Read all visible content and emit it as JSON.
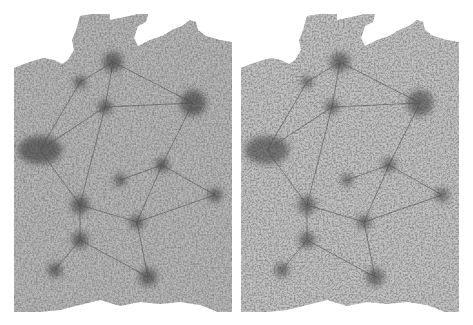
{
  "image": {
    "description": "Two side-by-side grayscale road-network density maps of the same country",
    "background": "#ffffff",
    "ink": "#3a3a3a",
    "panels": [
      {
        "id": "left",
        "offset_x": 0,
        "hubs": [
          {
            "x": 113,
            "y": 62,
            "r": 10
          },
          {
            "x": 193,
            "y": 103,
            "r": 13
          },
          {
            "x": 40,
            "y": 150,
            "r": 14
          },
          {
            "x": 80,
            "y": 82,
            "r": 6
          },
          {
            "x": 105,
            "y": 107,
            "r": 7
          },
          {
            "x": 162,
            "y": 165,
            "r": 7
          },
          {
            "x": 215,
            "y": 195,
            "r": 7
          },
          {
            "x": 80,
            "y": 205,
            "r": 9
          },
          {
            "x": 80,
            "y": 240,
            "r": 8
          },
          {
            "x": 137,
            "y": 222,
            "r": 7
          },
          {
            "x": 148,
            "y": 277,
            "r": 9
          },
          {
            "x": 55,
            "y": 270,
            "r": 7
          },
          {
            "x": 120,
            "y": 180,
            "r": 6
          }
        ]
      },
      {
        "id": "right",
        "offset_x": 227,
        "hubs": [
          {
            "x": 113,
            "y": 62,
            "r": 10
          },
          {
            "x": 193,
            "y": 103,
            "r": 13
          },
          {
            "x": 40,
            "y": 150,
            "r": 14
          },
          {
            "x": 80,
            "y": 82,
            "r": 6
          },
          {
            "x": 105,
            "y": 107,
            "r": 7
          },
          {
            "x": 162,
            "y": 165,
            "r": 7
          },
          {
            "x": 215,
            "y": 195,
            "r": 7
          },
          {
            "x": 80,
            "y": 205,
            "r": 9
          },
          {
            "x": 80,
            "y": 240,
            "r": 8
          },
          {
            "x": 137,
            "y": 222,
            "r": 7
          },
          {
            "x": 148,
            "y": 277,
            "r": 9
          },
          {
            "x": 55,
            "y": 270,
            "r": 7
          },
          {
            "x": 120,
            "y": 180,
            "r": 6
          }
        ]
      }
    ]
  }
}
